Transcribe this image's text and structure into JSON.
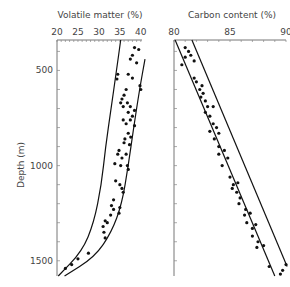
{
  "chart_data": [
    {
      "type": "scatter",
      "title": "Volatile matter (%)",
      "xlabel": "Volatile matter (%)",
      "ylabel": "Depth (m)",
      "x_ticks": [
        20,
        25,
        30,
        35,
        40
      ],
      "y_ticks": [
        500,
        1000,
        1500
      ],
      "xlim": [
        20,
        41
      ],
      "ylim": [
        1580,
        340
      ],
      "grid": false,
      "envelope_curves": [
        {
          "name": "left-bound",
          "points": [
            [
              35.2,
              340
            ],
            [
              34.2,
              500
            ],
            [
              32.9,
              700
            ],
            [
              31.6,
              900
            ],
            [
              30.6,
              1100
            ],
            [
              28.8,
              1300
            ],
            [
              26.0,
              1450
            ],
            [
              20.3,
              1580
            ]
          ]
        },
        {
          "name": "right-bound",
          "points": [
            [
              41.0,
              440
            ],
            [
              39.7,
              600
            ],
            [
              38.3,
              800
            ],
            [
              37.0,
              1000
            ],
            [
              35.5,
              1200
            ],
            [
              33.0,
              1350
            ],
            [
              29.0,
              1480
            ],
            [
              21.8,
              1580
            ]
          ]
        }
      ],
      "series": [
        {
          "name": "samples",
          "points": [
            [
              38.5,
              380
            ],
            [
              39.5,
              390
            ],
            [
              38.0,
              420
            ],
            [
              37.5,
              440
            ],
            [
              39.0,
              460
            ],
            [
              34.5,
              520
            ],
            [
              34.3,
              545
            ],
            [
              37.0,
              520
            ],
            [
              38.0,
              540
            ],
            [
              39.8,
              580
            ],
            [
              40.0,
              600
            ],
            [
              36.5,
              600
            ],
            [
              36.0,
              630
            ],
            [
              35.5,
              650
            ],
            [
              35.2,
              670
            ],
            [
              35.8,
              690
            ],
            [
              36.8,
              670
            ],
            [
              37.5,
              690
            ],
            [
              37.0,
              720
            ],
            [
              38.0,
              740
            ],
            [
              38.5,
              710
            ],
            [
              35.8,
              760
            ],
            [
              36.5,
              780
            ],
            [
              37.5,
              760
            ],
            [
              38.5,
              790
            ],
            [
              37.0,
              830
            ],
            [
              36.2,
              860
            ],
            [
              36.0,
              880
            ],
            [
              37.6,
              850
            ],
            [
              37.3,
              890
            ],
            [
              34.8,
              920
            ],
            [
              34.5,
              940
            ],
            [
              35.5,
              960
            ],
            [
              36.5,
              940
            ],
            [
              33.8,
              990
            ],
            [
              35.2,
              1000
            ],
            [
              36.8,
              1000
            ],
            [
              37.0,
              1020
            ],
            [
              34.0,
              1080
            ],
            [
              35.0,
              1100
            ],
            [
              35.5,
              1120
            ],
            [
              35.8,
              1140
            ],
            [
              33.5,
              1180
            ],
            [
              33.0,
              1210
            ],
            [
              33.5,
              1230
            ],
            [
              32.8,
              1260
            ],
            [
              34.8,
              1250
            ],
            [
              35.0,
              1220
            ],
            [
              31.5,
              1290
            ],
            [
              31.0,
              1320
            ],
            [
              32.0,
              1300
            ],
            [
              31.2,
              1350
            ],
            [
              31.5,
              1380
            ],
            [
              27.5,
              1460
            ],
            [
              25.0,
              1490
            ],
            [
              23.5,
              1520
            ],
            [
              22.0,
              1540
            ]
          ]
        }
      ]
    },
    {
      "type": "scatter",
      "title": "Carbon content (%)",
      "xlabel": "Carbon content (%)",
      "ylabel": "Depth (m)",
      "x_ticks": [
        80,
        85,
        90
      ],
      "y_ticks": [
        500,
        1000,
        1500
      ],
      "xlim": [
        80,
        90
      ],
      "ylim": [
        1580,
        340
      ],
      "grid": false,
      "envelope_curves": [
        {
          "name": "left-bound",
          "points": [
            [
              80.1,
              340
            ],
            [
              89.0,
              1580
            ]
          ]
        },
        {
          "name": "right-bound",
          "points": [
            [
              81.6,
              340
            ],
            [
              90.1,
              1530
            ]
          ]
        }
      ],
      "series": [
        {
          "name": "samples",
          "points": [
            [
              81.0,
              380
            ],
            [
              81.3,
              400
            ],
            [
              81.0,
              430
            ],
            [
              81.5,
              420
            ],
            [
              81.8,
              450
            ],
            [
              80.7,
              470
            ],
            [
              81.8,
              540
            ],
            [
              82.0,
              560
            ],
            [
              82.5,
              580
            ],
            [
              82.3,
              600
            ],
            [
              82.6,
              620
            ],
            [
              82.4,
              640
            ],
            [
              82.8,
              660
            ],
            [
              83.0,
              690
            ],
            [
              83.5,
              690
            ],
            [
              82.8,
              720
            ],
            [
              83.2,
              740
            ],
            [
              83.5,
              780
            ],
            [
              83.8,
              800
            ],
            [
              83.2,
              820
            ],
            [
              84.0,
              830
            ],
            [
              83.6,
              860
            ],
            [
              84.0,
              900
            ],
            [
              84.5,
              920
            ],
            [
              84.0,
              940
            ],
            [
              84.8,
              960
            ],
            [
              84.3,
              1000
            ],
            [
              85.0,
              1060
            ],
            [
              85.3,
              1100
            ],
            [
              85.2,
              1120
            ],
            [
              85.7,
              1090
            ],
            [
              85.6,
              1140
            ],
            [
              85.9,
              1170
            ],
            [
              85.8,
              1200
            ],
            [
              86.4,
              1230
            ],
            [
              86.3,
              1260
            ],
            [
              86.8,
              1250
            ],
            [
              86.5,
              1300
            ],
            [
              87.0,
              1330
            ],
            [
              87.3,
              1310
            ],
            [
              87.0,
              1370
            ],
            [
              87.5,
              1400
            ],
            [
              87.4,
              1430
            ],
            [
              88.0,
              1420
            ],
            [
              88.5,
              1530
            ],
            [
              89.7,
              1550
            ],
            [
              89.5,
              1570
            ],
            [
              90.0,
              1520
            ]
          ]
        }
      ]
    }
  ],
  "labels": {
    "left_title": "Volatile matter (%)",
    "right_title": "Carbon content (%)",
    "y_axis": "Depth (m)",
    "left_ticks": [
      "20",
      "25",
      "30",
      "35",
      "40"
    ],
    "right_ticks": [
      "80",
      "85",
      "90"
    ],
    "depth_ticks": [
      "500",
      "1000",
      "1500"
    ]
  }
}
